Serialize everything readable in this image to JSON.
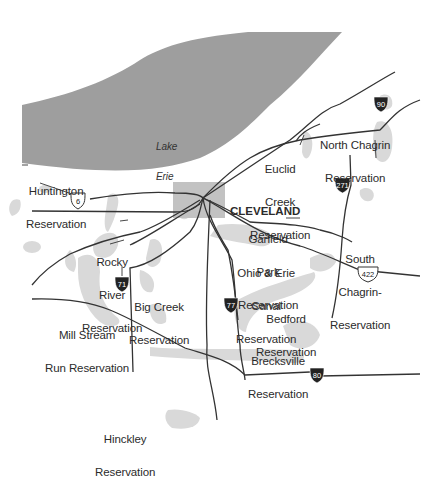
{
  "map": {
    "colors": {
      "lake": "#9e9e9e",
      "park": "#d9d9d9",
      "city": "#c2c2c2",
      "road": "#333333",
      "text": "#2b2b2b"
    },
    "water": {
      "name_line1": "Lake",
      "name_line2": "Erie"
    },
    "city": {
      "name": "CLEVELAND"
    },
    "reservations": [
      {
        "id": "huntington",
        "line1": "Huntington",
        "line2": "Reservation"
      },
      {
        "id": "euclid-creek",
        "line1": "Euclid",
        "line2": "Creek",
        "line3": "Reservation"
      },
      {
        "id": "north-chagrin",
        "line1": "North Chagrin",
        "line2": "Reservation"
      },
      {
        "id": "garfield-park",
        "line1": "Garfield",
        "line2": "Park",
        "line3": "Reservation"
      },
      {
        "id": "rocky-river",
        "line1": "Rocky",
        "line2": "River",
        "line3": "Reservation"
      },
      {
        "id": "south-chagrin",
        "line1": "South",
        "line2": "Chagrin-",
        "line3": "Reservation"
      },
      {
        "id": "ohio-erie-canal",
        "line1": "Ohio & Erie",
        "line2": "Canal",
        "line3": "Reservation"
      },
      {
        "id": "big-creek",
        "line1": "Big Creek",
        "line2": "Reservation"
      },
      {
        "id": "mill-stream-run",
        "line1": "Mill Stream",
        "line2": "Run Reservation"
      },
      {
        "id": "bedford",
        "line1": "Bedford",
        "line2": "Reservation"
      },
      {
        "id": "brecksville",
        "line1": "Brecksville",
        "line2": "Reservation"
      },
      {
        "id": "hinckley",
        "line1": "Hinckley",
        "line2": "Reservation"
      }
    ],
    "highways": {
      "us": [
        {
          "number": "6"
        },
        {
          "number": "422"
        }
      ],
      "interstate": [
        {
          "number": "90"
        },
        {
          "number": "271"
        },
        {
          "number": "71"
        },
        {
          "number": "77"
        },
        {
          "number": "80"
        }
      ]
    }
  }
}
